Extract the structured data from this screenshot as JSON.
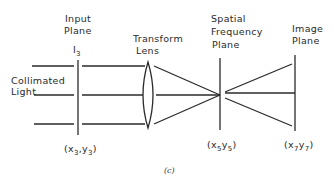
{
  "diagram": {
    "type": "optical-fourier-transform-system",
    "caption": "(c)",
    "source_label": [
      "Collimated",
      "Light"
    ],
    "components": [
      {
        "id": "input-plane",
        "label": [
          "Input",
          "Plane"
        ],
        "symbol": "I",
        "symbol_sub": "3",
        "coords": {
          "x": "x",
          "x_sub": "3",
          "y": "y",
          "y_sub": "3"
        }
      },
      {
        "id": "transform-lens",
        "label": [
          "Transform",
          "Lens"
        ]
      },
      {
        "id": "spatial-frequency-plane",
        "label": [
          "Spatial",
          "Frequency",
          "Plane"
        ],
        "coords": {
          "x": "x",
          "x_sub": "5",
          "y": "y",
          "y_sub": "5"
        }
      },
      {
        "id": "image-plane",
        "label": [
          "Image",
          "Plane"
        ],
        "coords": {
          "x": "x",
          "x_sub": "7",
          "y": "y",
          "y_sub": "7"
        }
      }
    ],
    "colors": {
      "line": "#2a2a2a",
      "background": "#ffffff"
    }
  }
}
